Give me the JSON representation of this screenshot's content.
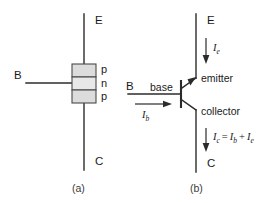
{
  "figure": {
    "background_color": "#ffffff",
    "line_color": "#2b2b2b",
    "layer_fill_color": "#d9d9d9",
    "layer_fill_color_alt": "#e6e6e6"
  },
  "panel_a": {
    "caption": "(a)",
    "terminals": {
      "emitter": "E",
      "base": "B",
      "collector": "C"
    },
    "layers": [
      {
        "label": "p",
        "type": "p-type"
      },
      {
        "label": "n",
        "type": "n-type"
      },
      {
        "label": "p",
        "type": "p-type"
      }
    ]
  },
  "panel_b": {
    "caption": "(b)",
    "terminals": {
      "emitter": "E",
      "base": "B",
      "collector": "C"
    },
    "roles": {
      "base": "base",
      "emitter": "emitter",
      "collector": "collector"
    },
    "currents": {
      "emitter_current": {
        "symbol": "I",
        "subscript": "e"
      },
      "base_current": {
        "symbol": "I",
        "subscript": "b"
      },
      "collector_current": {
        "symbol": "I",
        "subscript": "c",
        "equation_operator": "=",
        "term1_symbol": "I",
        "term1_subscript": "b",
        "plus_operator": "+",
        "term2_symbol": "I",
        "term2_subscript": "e"
      }
    }
  }
}
